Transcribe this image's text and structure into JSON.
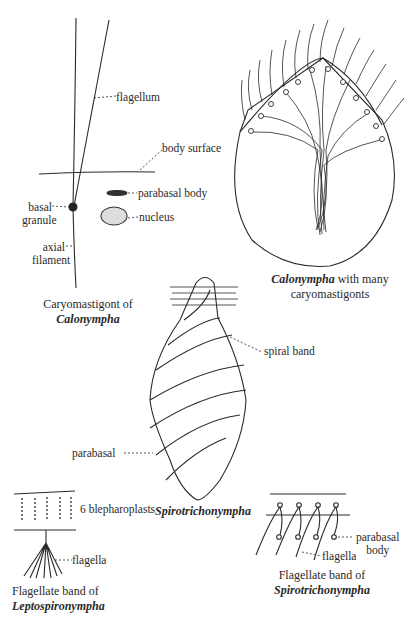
{
  "figures": {
    "caryomastigont": {
      "labels": {
        "flagellum": "flagellum",
        "body_surface": "body surface",
        "parabasal_body": "parabasal body",
        "basal_granule_1": "basal",
        "basal_granule_2": "granule",
        "nucleus": "nucleus",
        "axial_filament_1": "axial",
        "axial_filament_2": "filament"
      },
      "caption": {
        "line1": "Caryomastigont of",
        "line2_italic": "Calonympha"
      }
    },
    "calonympha": {
      "caption": {
        "line1_italic": "Calonympha",
        "line1_rest": " with many",
        "line2": "caryomastigonts"
      }
    },
    "spirotrichonympha": {
      "labels": {
        "spiral_band": "spiral band",
        "parabasal": "parabasal"
      },
      "caption_italic": "Spirotrichonympha"
    },
    "leptospironympha_band": {
      "labels": {
        "blepharoplasts": "6 blepharoplasts",
        "flagella": "flagella"
      },
      "caption": {
        "line1": "Flagellate band of",
        "line2_italic": "Leptospironympha"
      }
    },
    "spirotrichonympha_band": {
      "labels": {
        "parabasal_1": "parabasal",
        "parabasal_2": "body",
        "flagella": "flagella"
      },
      "caption": {
        "line1": "Flagellate band of",
        "line2_italic": "Spirotrichonympha"
      }
    }
  }
}
